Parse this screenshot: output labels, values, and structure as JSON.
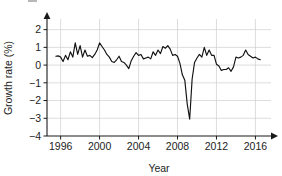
{
  "chart_data": {
    "type": "line",
    "title": "",
    "xlabel": "Year",
    "ylabel": "Growth rate (%)",
    "xlim": [
      1994.6,
      2017.6
    ],
    "ylim": [
      -4,
      2.6
    ],
    "xticks": [
      1996,
      2000,
      2004,
      2008,
      2012,
      2016
    ],
    "xtick_labels": [
      "1996",
      "2000",
      "2004",
      "2008",
      "2012",
      "2016"
    ],
    "yticks": [
      -4,
      -3,
      -2,
      -1,
      0,
      1,
      2
    ],
    "ytick_labels": [
      "−4",
      "−3",
      "−2",
      "−1",
      "0",
      "1",
      "2"
    ],
    "grid": true,
    "legend": null,
    "series": [
      {
        "name": "Growth rate (%)",
        "color": "#121212",
        "x": [
          1995.5,
          1995.75,
          1996.0,
          1996.25,
          1996.5,
          1996.75,
          1997.0,
          1997.25,
          1997.5,
          1997.75,
          1998.0,
          1998.25,
          1998.5,
          1998.75,
          1999.0,
          1999.25,
          1999.5,
          1999.75,
          2000.0,
          2000.25,
          2000.5,
          2000.75,
          2001.0,
          2001.25,
          2001.5,
          2001.75,
          2002.0,
          2002.25,
          2002.5,
          2002.75,
          2003.0,
          2003.25,
          2003.5,
          2003.75,
          2004.0,
          2004.25,
          2004.5,
          2004.75,
          2005.0,
          2005.25,
          2005.5,
          2005.75,
          2006.0,
          2006.25,
          2006.5,
          2006.75,
          2007.0,
          2007.25,
          2007.5,
          2007.75,
          2008.0,
          2008.25,
          2008.5,
          2008.75,
          2009.0,
          2009.25,
          2009.5,
          2009.75,
          2010.0,
          2010.25,
          2010.5,
          2010.75,
          2011.0,
          2011.25,
          2011.5,
          2011.75,
          2012.0,
          2012.25,
          2012.5,
          2012.75,
          2013.0,
          2013.25,
          2013.5,
          2013.75,
          2014.0,
          2014.25,
          2014.5,
          2014.75,
          2015.0,
          2015.25,
          2015.5,
          2015.75,
          2016.0,
          2016.25,
          2016.5
        ],
        "values": [
          0.5,
          0.52,
          0.45,
          0.2,
          0.55,
          0.3,
          0.75,
          0.45,
          1.25,
          0.6,
          1.1,
          0.45,
          0.85,
          0.5,
          0.55,
          0.42,
          0.6,
          0.85,
          1.25,
          1.05,
          0.85,
          0.6,
          0.45,
          0.2,
          0.15,
          0.3,
          0.5,
          0.2,
          0.15,
          0.0,
          -0.2,
          0.25,
          0.5,
          0.7,
          0.55,
          0.6,
          0.35,
          0.4,
          0.45,
          0.35,
          0.75,
          0.55,
          0.85,
          0.65,
          1.05,
          0.95,
          1.1,
          0.9,
          0.55,
          0.6,
          0.5,
          0.1,
          -0.55,
          -0.85,
          -2.2,
          -3.05,
          -0.8,
          0.15,
          0.4,
          0.6,
          0.45,
          1.0,
          0.55,
          0.85,
          0.55,
          0.55,
          0.05,
          -0.05,
          -0.3,
          -0.25,
          -0.25,
          -0.15,
          -0.35,
          -0.1,
          0.45,
          0.4,
          0.45,
          0.55,
          0.85,
          0.6,
          0.5,
          0.4,
          0.45,
          0.35,
          0.3
        ]
      }
    ]
  },
  "axes": {
    "y_axis_label": "Growth rate (%)",
    "x_axis_label": "Year"
  }
}
